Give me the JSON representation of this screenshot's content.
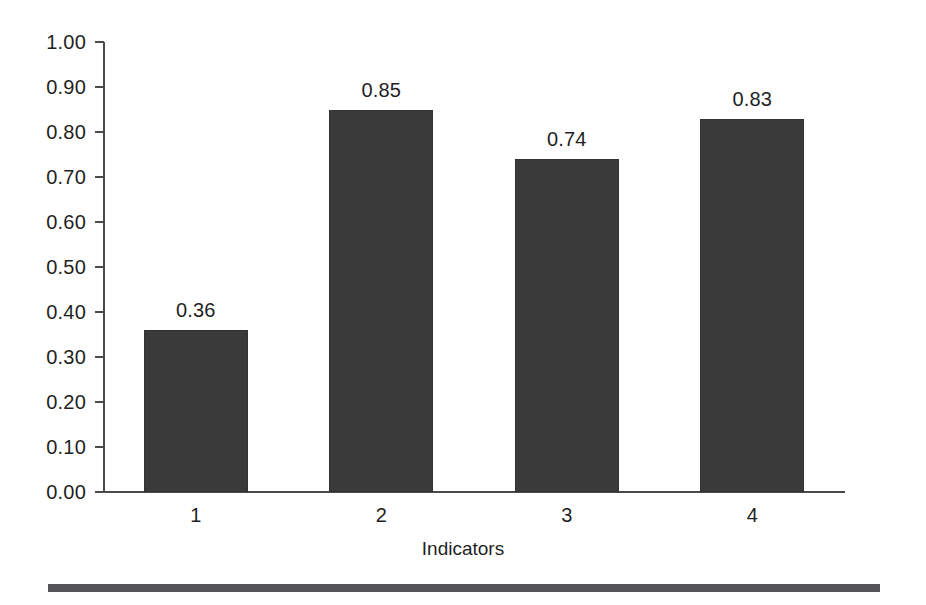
{
  "chart_data": {
    "type": "bar",
    "title": "",
    "subtitle": "",
    "xlabel": "Indicators",
    "ylabel": "",
    "categories": [
      "1",
      "2",
      "3",
      "4"
    ],
    "values": [
      0.36,
      0.85,
      0.74,
      0.83
    ],
    "value_labels": [
      "0.36",
      "0.85",
      "0.74",
      "0.83"
    ],
    "ylim": [
      0.0,
      1.0
    ],
    "ytick_labels": [
      "1.00",
      "0.90",
      "0.80",
      "0.70",
      "0.60",
      "0.50",
      "0.40",
      "0.30",
      "0.20",
      "0.10",
      "0.00"
    ],
    "ytick_values": [
      1.0,
      0.9,
      0.8,
      0.7,
      0.6,
      0.5,
      0.4,
      0.3,
      0.2,
      0.1,
      0.0
    ],
    "grid": false,
    "legend": false,
    "legend_position": "none",
    "series": [
      {
        "name": "Indicators",
        "values": [
          0.36,
          0.85,
          0.74,
          0.83
        ],
        "color": "#3a3a3a"
      }
    ],
    "bar_color": "#3a3a3a",
    "axis_color": "#4a4a4a",
    "text_color": "#1f1f1f",
    "background_color": "#ffffff",
    "annotations": []
  },
  "footer": {
    "rule_color": "#55555a"
  }
}
